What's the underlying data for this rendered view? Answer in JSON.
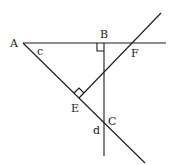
{
  "diagram": {
    "type": "geometry",
    "points": {
      "A": "A",
      "B": "B",
      "C": "C",
      "E": "E",
      "F": "F"
    },
    "angle_labels": {
      "c": "c",
      "d": "d"
    },
    "right_angles": [
      "B",
      "E"
    ],
    "line_color": "#1a1a1a"
  }
}
